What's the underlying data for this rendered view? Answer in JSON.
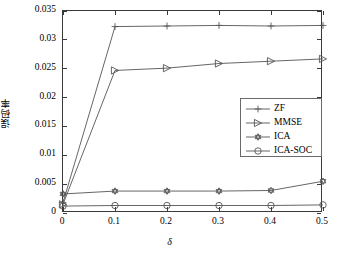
{
  "chart_data": {
    "type": "line",
    "title": "",
    "xlabel": "δ",
    "ylabel": "误码率",
    "xlim": [
      0,
      0.5
    ],
    "ylim": [
      0,
      0.035
    ],
    "grid": false,
    "legend_position": "center-right",
    "x": [
      0,
      0.1,
      0.2,
      0.3,
      0.4,
      0.5
    ],
    "xticklabels": [
      "0",
      "0.1",
      "0.2",
      "0.3",
      "0.4",
      "0.5"
    ],
    "yticks": [
      0,
      0.005,
      0.01,
      0.015,
      0.02,
      0.025,
      0.03,
      0.035
    ],
    "yticklabels": [
      "0",
      "0.005",
      "0.01",
      "0.015",
      "0.02",
      "0.025",
      "0.03",
      "0.035"
    ],
    "series": [
      {
        "name": "ZF",
        "marker": "plus",
        "color": "#555555",
        "values": [
          0.0018,
          0.0323,
          0.0324,
          0.0325,
          0.0324,
          0.0325
        ]
      },
      {
        "name": "MMSE",
        "marker": "triangle-right",
        "color": "#555555",
        "values": [
          0.0015,
          0.0247,
          0.0251,
          0.0259,
          0.0263,
          0.0267
        ]
      },
      {
        "name": "ICA",
        "marker": "hexagram",
        "color": "#555555",
        "values": [
          0.0033,
          0.0038,
          0.0038,
          0.0038,
          0.0039,
          0.0055
        ]
      },
      {
        "name": "ICA-SOC",
        "marker": "circle",
        "color": "#555555",
        "values": [
          0.0012,
          0.0013,
          0.0013,
          0.0013,
          0.0013,
          0.0014
        ]
      }
    ]
  },
  "legend": {
    "entries": [
      {
        "label": "ZF",
        "marker": "plus-icon"
      },
      {
        "label": "MMSE",
        "marker": "triangle-right-icon"
      },
      {
        "label": "ICA",
        "marker": "hexagram-icon"
      },
      {
        "label": "ICA-SOC",
        "marker": "circle-icon"
      }
    ]
  }
}
